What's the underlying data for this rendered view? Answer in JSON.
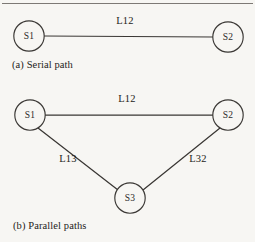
{
  "figure": {
    "background_color": "#f7f6f3",
    "stroke_color": "#3a3734",
    "text_color": "#1e1c1a",
    "rule_color": "#6e6b67"
  },
  "diagram_a": {
    "caption": "(a) Serial path",
    "nodes": [
      {
        "id": "a-s1",
        "label": "S1",
        "cx": 29,
        "cy": 36,
        "r": 15.2
      },
      {
        "id": "a-s2",
        "label": "S2",
        "cx": 228,
        "cy": 37,
        "r": 15.2
      }
    ],
    "edges": [
      {
        "id": "a-l12",
        "label": "L12",
        "from": "S1",
        "to": "S2",
        "x1": 44,
        "y1": 36,
        "x2": 213,
        "y2": 37,
        "label_x": 125,
        "label_y": 22
      }
    ]
  },
  "diagram_b": {
    "caption": "(b) Parallel paths",
    "nodes": [
      {
        "id": "b-s1",
        "label": "S1",
        "cx": 30,
        "cy": 115,
        "r": 15.2
      },
      {
        "id": "b-s2",
        "label": "S2",
        "cx": 228,
        "cy": 115,
        "r": 15.2
      },
      {
        "id": "b-s3",
        "label": "S3",
        "cx": 130,
        "cy": 198,
        "r": 15.2
      }
    ],
    "edges": [
      {
        "id": "b-l12",
        "label": "L12",
        "from": "S1",
        "to": "S2",
        "x1": 45,
        "y1": 115,
        "x2": 213,
        "y2": 115,
        "label_x": 127,
        "label_y": 100
      },
      {
        "id": "b-l13",
        "label": "L13",
        "from": "S1",
        "to": "S3",
        "x1": 38,
        "y1": 128,
        "x2": 118,
        "y2": 190,
        "label_x": 68,
        "label_y": 160
      },
      {
        "id": "b-l32",
        "label": "L32",
        "from": "S3",
        "to": "S2",
        "x1": 143,
        "y1": 190,
        "x2": 220,
        "y2": 128,
        "label_x": 198,
        "label_y": 160
      }
    ]
  },
  "captions": {
    "a_x": 12,
    "a_y": 66,
    "b_x": 13,
    "b_y": 227
  },
  "top_rule": {
    "x1": 2,
    "y1": 3.5,
    "x2": 253,
    "y2": 3.5
  }
}
